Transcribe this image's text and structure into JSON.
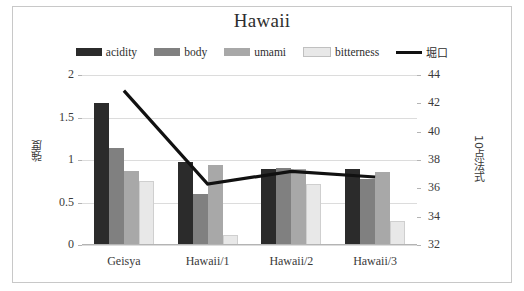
{
  "chart_data": {
    "type": "bar",
    "title": "Hawaii",
    "categories": [
      "Geisya",
      "Hawaii/1",
      "Hawaii/2",
      "Hawaii/3"
    ],
    "series": [
      {
        "name": "acidity",
        "type": "bar",
        "axis": "left",
        "color": "#2b2b2b",
        "values": [
          1.67,
          0.98,
          0.9,
          0.9
        ]
      },
      {
        "name": "body",
        "type": "bar",
        "axis": "left",
        "color": "#808080",
        "values": [
          1.14,
          0.6,
          0.91,
          0.78
        ]
      },
      {
        "name": "umami",
        "type": "bar",
        "axis": "left",
        "color": "#a8a8a8",
        "values": [
          0.87,
          0.94,
          0.9,
          0.86
        ]
      },
      {
        "name": "bitterness",
        "type": "bar",
        "axis": "left",
        "color": "#e8e8e8",
        "values": [
          0.75,
          0.12,
          0.72,
          0.28
        ]
      },
      {
        "name": "堀口",
        "type": "line",
        "axis": "right",
        "color": "#111111",
        "values": [
          42.9,
          36.3,
          37.2,
          36.8
        ]
      }
    ],
    "xlabel": "",
    "ylabel": "強度",
    "ylabel_right": "10点法式",
    "ylim": [
      0,
      2
    ],
    "yticks": [
      "0",
      "0.5",
      "1",
      "1.5",
      "2"
    ],
    "ylim_right": [
      32,
      44
    ],
    "yticks_right": [
      "32",
      "34",
      "36",
      "38",
      "40",
      "42",
      "44"
    ],
    "grid": true,
    "legend_position": "top"
  },
  "legend": {
    "items": [
      {
        "label": "acidity",
        "swatch": "bar-swatch-acidity"
      },
      {
        "label": "body",
        "swatch": "bar-swatch-body"
      },
      {
        "label": "umami",
        "swatch": "bar-swatch-umami"
      },
      {
        "label": "bitterness",
        "swatch": "bar-swatch-bitterness"
      },
      {
        "label": "堀口",
        "swatch": "line-swatch-horiguchi"
      }
    ]
  }
}
